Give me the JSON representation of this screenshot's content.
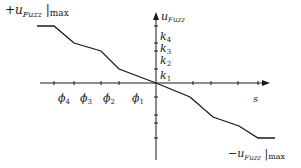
{
  "diagram": {
    "colors": {
      "line": "#1a1a1a",
      "background": "#ffffff"
    },
    "axes": {
      "x_label": "s",
      "y_label_base": "u",
      "y_label_sub": "Fuzz",
      "origin": [
        156,
        83
      ]
    },
    "labels": {
      "top_left": {
        "sign": "+",
        "base": "u",
        "sub": "Fuzz",
        "suffix": "max"
      },
      "bottom_right": {
        "sign": "−",
        "base": "u",
        "sub": "Fuzz",
        "suffix": "max"
      }
    },
    "x_ticks": [
      {
        "name": "phi4",
        "base": "ϕ",
        "sub": "4",
        "x": 54
      },
      {
        "name": "phi3",
        "base": "ϕ",
        "sub": "3",
        "x": 74
      },
      {
        "name": "phi2",
        "base": "ϕ",
        "sub": "2",
        "x": 101
      },
      {
        "name": "phi1",
        "base": "ϕ",
        "sub": "1",
        "x": 119
      }
    ],
    "y_ticks": [
      {
        "name": "k4",
        "base": "k",
        "sub": "4",
        "y": 26
      },
      {
        "name": "k3",
        "base": "k",
        "sub": "3",
        "y": 43
      },
      {
        "name": "k2",
        "base": "k",
        "sub": "2",
        "y": 51
      },
      {
        "name": "k1",
        "base": "k",
        "sub": "1",
        "y": 69
      }
    ],
    "curve_points": [
      [
        37,
        26
      ],
      [
        54,
        26
      ],
      [
        74,
        43
      ],
      [
        101,
        51
      ],
      [
        119,
        69
      ],
      [
        156,
        83
      ],
      [
        190,
        97
      ],
      [
        213,
        117
      ],
      [
        239,
        126
      ],
      [
        258,
        138
      ],
      [
        275,
        138
      ]
    ]
  }
}
